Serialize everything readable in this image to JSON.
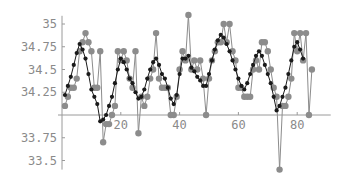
{
  "chart_data": {
    "type": "line",
    "title": "",
    "xlabel": "",
    "ylabel": "",
    "xlim": [
      0,
      88
    ],
    "ylim": [
      33.4,
      35.2
    ],
    "axis_origin": {
      "x": 0,
      "y": 34
    },
    "grid": false,
    "legend": null,
    "x_ticks": [
      20,
      40,
      60,
      80
    ],
    "x_tick_labels": [
      "20",
      "40",
      "60",
      "80"
    ],
    "y_ticks": [
      33.5,
      33.75,
      34.25,
      34.5,
      34.75,
      35
    ],
    "y_tick_labels": [
      "33.5",
      "33.75",
      "34.25",
      "34.5",
      "34.75",
      "35"
    ],
    "series": [
      {
        "name": "observed",
        "color": "#8c8c8c",
        "marker": "circle-large",
        "x": [
          1,
          2,
          3,
          4,
          5,
          6,
          7,
          8,
          9,
          10,
          11,
          12,
          13,
          14,
          15,
          16,
          17,
          18,
          19,
          20,
          21,
          22,
          23,
          24,
          25,
          26,
          27,
          28,
          29,
          30,
          31,
          32,
          33,
          34,
          35,
          36,
          37,
          38,
          39,
          40,
          41,
          42,
          43,
          44,
          45,
          46,
          47,
          48,
          49,
          50,
          51,
          52,
          53,
          54,
          55,
          56,
          57,
          58,
          59,
          60,
          61,
          62,
          63,
          64,
          65,
          66,
          67,
          68,
          69,
          70,
          71,
          72,
          73,
          74,
          75,
          76,
          77,
          78,
          79,
          80,
          81,
          82,
          83,
          84,
          85
        ],
        "values": [
          34.1,
          34.2,
          34.3,
          34.3,
          34.4,
          34.7,
          34.8,
          34.9,
          34.8,
          34.7,
          34.3,
          34.3,
          34.7,
          33.7,
          33.9,
          33.9,
          34.0,
          34.1,
          34.7,
          34.6,
          34.7,
          34.6,
          34.4,
          34.3,
          34.7,
          33.8,
          34.2,
          34.1,
          34.2,
          34.4,
          34.5,
          34.9,
          34.4,
          34.3,
          34.3,
          34.3,
          34.0,
          34.0,
          34.2,
          34.5,
          34.7,
          34.6,
          35.1,
          34.5,
          34.6,
          34.5,
          34.6,
          34.4,
          34.0,
          34.4,
          34.6,
          34.7,
          34.8,
          34.8,
          35.0,
          34.8,
          35.0,
          34.7,
          34.6,
          34.3,
          34.3,
          34.2,
          34.2,
          34.2,
          34.5,
          34.6,
          34.5,
          34.8,
          34.8,
          34.7,
          34.5,
          34.3,
          34.2,
          33.4,
          34.1,
          34.1,
          34.2,
          34.4,
          34.9,
          34.7,
          34.9,
          34.6,
          34.9,
          34.0,
          34.5
        ],
        "note": "last points approximate; series ends at x=85"
      },
      {
        "name": "smoothed",
        "color": "#1a1a1a",
        "marker": "dot-small",
        "x": [
          1,
          2,
          3,
          4,
          5,
          6,
          7,
          8,
          9,
          10,
          11,
          12,
          13,
          14,
          15,
          16,
          17,
          18,
          19,
          20,
          21,
          22,
          23,
          24,
          25,
          26,
          27,
          28,
          29,
          30,
          31,
          32,
          33,
          34,
          35,
          36,
          37,
          38,
          39,
          40,
          41,
          42,
          43,
          44,
          45,
          46,
          47,
          48,
          49,
          50,
          51,
          52,
          53,
          54,
          55,
          56,
          57,
          58,
          59,
          60,
          61,
          62,
          63,
          64,
          65,
          66,
          67,
          68,
          69,
          70,
          71,
          72,
          73,
          74,
          75,
          76,
          77,
          78,
          79,
          80,
          81,
          82
        ],
        "values": [
          34.22,
          34.32,
          34.42,
          34.55,
          34.68,
          34.78,
          34.72,
          34.62,
          34.45,
          34.28,
          34.2,
          34.12,
          33.93,
          33.95,
          34.0,
          34.1,
          34.2,
          34.35,
          34.5,
          34.62,
          34.58,
          34.5,
          34.4,
          34.35,
          34.25,
          34.18,
          34.2,
          34.28,
          34.4,
          34.5,
          34.58,
          34.62,
          34.55,
          34.45,
          34.4,
          34.3,
          34.18,
          34.12,
          34.22,
          34.45,
          34.62,
          34.62,
          34.65,
          34.52,
          34.48,
          34.42,
          34.38,
          34.32,
          34.32,
          34.45,
          34.6,
          34.72,
          34.82,
          34.88,
          34.85,
          34.78,
          34.7,
          34.6,
          34.5,
          34.4,
          34.32,
          34.28,
          34.35,
          34.45,
          34.55,
          34.65,
          34.7,
          34.65,
          34.55,
          34.45,
          34.35,
          34.2,
          34.05,
          34.1,
          34.2,
          34.3,
          34.45,
          34.6,
          34.75,
          34.8,
          34.72,
          34.62
        ]
      }
    ]
  }
}
